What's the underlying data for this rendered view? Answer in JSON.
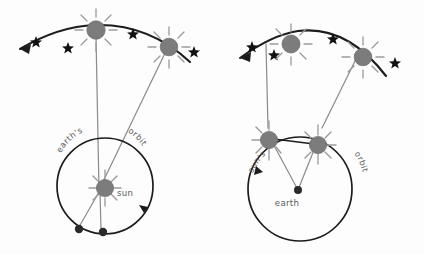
{
  "figure": {
    "background_color": "#fdfdfd",
    "width": 424,
    "height": 254
  },
  "colors": {
    "ink": "#1c1c1c",
    "sun_fill": "#7c7c7c",
    "sun_ray": "#9c9c9c",
    "sight_line": "#8d8d8d",
    "earth_dot": "#2a2a2a",
    "star": "#111111",
    "label_text": "#5d5d5d"
  },
  "panels": [
    {
      "id": "left-panel",
      "name": "heliocentric-parallax-panel",
      "labels": {
        "orbit_word_1": "earth's",
        "orbit_word_2": "orbit",
        "center_body": "sun"
      },
      "center_body_type": "sun",
      "orbiting_body_type": "earth",
      "orbiting_body_count": 2,
      "sun_symbols_on_arc": 2,
      "star_marks": 4,
      "arc_arrow_direction": "left",
      "orbit_arrow_direction": "clockwise"
    },
    {
      "id": "right-panel",
      "name": "geocentric-parallax-panel",
      "labels": {
        "orbit_word_1": "sun's",
        "orbit_word_2": "orbit",
        "center_body": "earth"
      },
      "center_body_type": "earth",
      "orbiting_body_type": "sun",
      "orbiting_body_count": 2,
      "sun_symbols_on_arc": 2,
      "star_marks": 4,
      "arc_arrow_direction": "left",
      "orbit_arrow_direction": "counterclockwise"
    }
  ]
}
